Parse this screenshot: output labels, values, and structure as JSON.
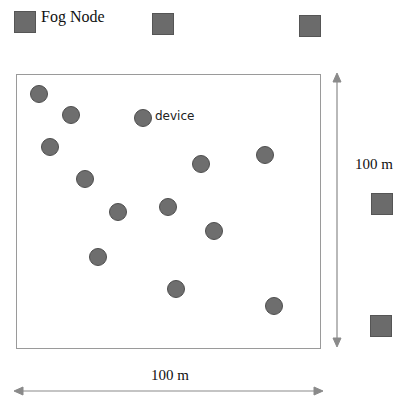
{
  "legend": {
    "fog_node_label": "Fog Node",
    "device_label": "device"
  },
  "dimensions": {
    "width_label": "100 m",
    "height_label": "100 m"
  },
  "colors": {
    "node_fill": "#6b6b6b",
    "device_fill": "#6e6e6e",
    "area_border": "#9a9a9a",
    "arrow": "#8a8a8a"
  },
  "fog_nodes": [
    {
      "x": 14,
      "y": 11,
      "role": "legend"
    },
    {
      "x": 152,
      "y": 13
    },
    {
      "x": 299,
      "y": 15
    },
    {
      "x": 371,
      "y": 193
    },
    {
      "x": 370,
      "y": 315
    }
  ],
  "devices": [
    {
      "x": 39,
      "y": 94
    },
    {
      "x": 71,
      "y": 115
    },
    {
      "x": 143,
      "y": 118
    },
    {
      "x": 50,
      "y": 147
    },
    {
      "x": 85,
      "y": 179
    },
    {
      "x": 201,
      "y": 164
    },
    {
      "x": 265,
      "y": 155
    },
    {
      "x": 118,
      "y": 212
    },
    {
      "x": 168,
      "y": 207
    },
    {
      "x": 214,
      "y": 231
    },
    {
      "x": 98,
      "y": 257
    },
    {
      "x": 176,
      "y": 289
    },
    {
      "x": 274,
      "y": 306
    }
  ]
}
